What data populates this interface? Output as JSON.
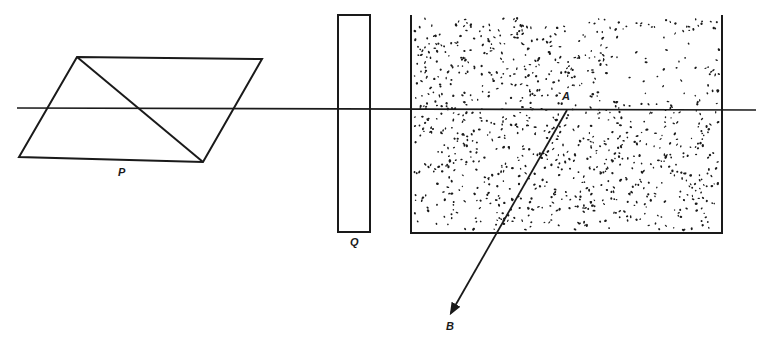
{
  "diagram": {
    "type": "optics-schematic",
    "colors": {
      "ink": "#1a1a1a",
      "background": "#ffffff"
    },
    "optical_axis": {
      "x1": 17,
      "y1": 108,
      "x2": 756,
      "y2": 110
    },
    "prism": {
      "label": "P",
      "label_pos": [
        118,
        176
      ],
      "vertices": [
        [
          77,
          57
        ],
        [
          262,
          59
        ],
        [
          203,
          162
        ],
        [
          19,
          157
        ]
      ],
      "diagonal": [
        [
          77,
          57
        ],
        [
          203,
          162
        ]
      ]
    },
    "plate": {
      "label": "Q",
      "label_pos": [
        350,
        246
      ],
      "x": 338,
      "y": 15,
      "width": 32,
      "height": 217
    },
    "medium": {
      "x": 411,
      "y": 15,
      "width": 311,
      "height": 218,
      "fill": "stippled"
    },
    "point_a": {
      "label": "A",
      "label_pos": [
        562,
        100
      ],
      "x": 567,
      "y": 110
    },
    "ray_b": {
      "label": "B",
      "label_pos": [
        446,
        330
      ],
      "x1": 567,
      "y1": 110,
      "x2": 451,
      "y2": 313
    }
  }
}
